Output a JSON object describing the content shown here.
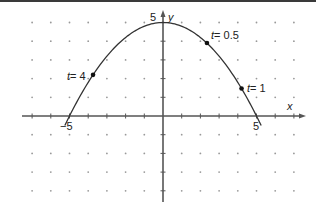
{
  "chart_data": {
    "type": "line",
    "title": "",
    "xlabel": "x",
    "ylabel": "y",
    "xlim": [
      -7,
      7
    ],
    "ylim": [
      -4.5,
      5.2
    ],
    "grid": "dots",
    "tick_labels": {
      "x": [
        "-5",
        "5"
      ],
      "y": [
        "5"
      ]
    },
    "x_tick_label_texts": {
      "neg5": "−5",
      "pos5": "5"
    },
    "y_tick_label_text": "5",
    "curve": {
      "equation": "y = 5 - x^2/5",
      "x": [
        -5.2,
        -4,
        -3,
        -2,
        -1,
        0,
        1,
        2,
        3,
        4,
        5.2
      ],
      "y": [
        -0.41,
        1.8,
        3.2,
        4.2,
        4.8,
        5,
        4.8,
        4.2,
        3.2,
        1.8,
        -0.41
      ]
    },
    "points": [
      {
        "label": "t = 4",
        "t": 4,
        "x": -3.74,
        "y": 2.2
      },
      {
        "label": "t = 0.5",
        "t": 0.5,
        "x": 2.35,
        "y": 3.9
      },
      {
        "label": "t = 1",
        "t": 1,
        "x": 4.2,
        "y": 1.47
      }
    ]
  },
  "labels": {
    "x_axis": "x",
    "y_axis": "y",
    "x_neg5": "−5",
    "x_pos5": "5",
    "y_pos5": "5",
    "t4": "t = 4",
    "t05": "t = 0.5",
    "t1": "t = 1"
  },
  "colors": {
    "axis": "#555555",
    "curve": "#333333",
    "dot": "#111111",
    "grid": "#999999"
  }
}
